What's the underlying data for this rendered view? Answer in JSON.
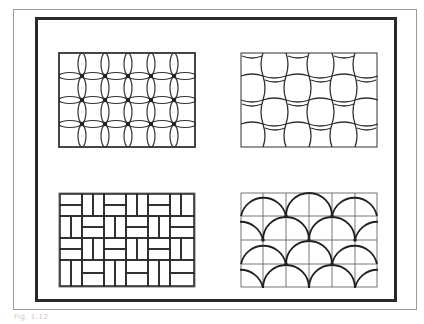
{
  "figure": {
    "caption": "Fig. 1.12",
    "frame_color": "#2a2a2a",
    "outer_frame_color": "#9a9a9a",
    "line_color": "#333333"
  },
  "panels": [
    {
      "id": "top-left",
      "pattern": "interlaced-ovals-grid",
      "columns": 6,
      "rows": 4
    },
    {
      "id": "top-right",
      "pattern": "basket-weave-curved",
      "columns": 6,
      "rows": 4
    },
    {
      "id": "bottom-left",
      "pattern": "herringbone-brick",
      "columns": 6,
      "rows": 4
    },
    {
      "id": "bottom-right",
      "pattern": "fish-scale-arcs-grid",
      "columns": 6,
      "rows": 4
    }
  ]
}
